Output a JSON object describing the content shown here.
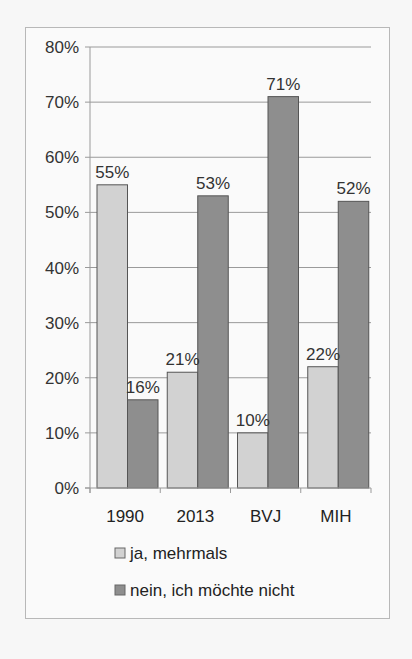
{
  "chart_data": {
    "type": "bar",
    "title": "",
    "xlabel": "",
    "ylabel": "",
    "categories": [
      "1990",
      "2013",
      "BVJ",
      "MIH"
    ],
    "series": [
      {
        "name": "ja, mehrmals",
        "color": "#d2d2d2",
        "values": [
          55,
          21,
          10,
          22
        ],
        "labels": [
          "55%",
          "21%",
          "10%",
          "22%"
        ]
      },
      {
        "name": "nein, ich möchte nicht",
        "color": "#8e8e8e",
        "values": [
          16,
          53,
          71,
          52
        ],
        "labels": [
          "16%",
          "53%",
          "71%",
          "52%"
        ]
      }
    ],
    "ylim": [
      0,
      80
    ],
    "yticks": [
      0,
      10,
      20,
      30,
      40,
      50,
      60,
      70,
      80
    ],
    "ytick_labels": [
      "0%",
      "10%",
      "20%",
      "30%",
      "40%",
      "50%",
      "60%",
      "70%",
      "80%"
    ],
    "grid": true,
    "legend_position": "bottom-center"
  }
}
